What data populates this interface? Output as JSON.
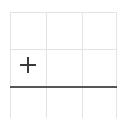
{
  "canvas": {
    "width": 127,
    "height": 125,
    "background": "#ffffff"
  },
  "colors": {
    "grid": "#e3e3e3",
    "axis_rule": "#555555",
    "marker": "#3a3a3a",
    "background": "#ffffff"
  },
  "chart_data": {
    "type": "scatter",
    "title": "",
    "subtitle": "",
    "xlabel": "",
    "ylabel": "",
    "grid": true,
    "legend": false,
    "legend_position": "none",
    "annotations": [],
    "xlim": [
      0,
      3
    ],
    "ylim": [
      0,
      3
    ],
    "xticks": [
      0,
      1,
      2,
      3
    ],
    "yticks": [
      0,
      1,
      2,
      3
    ],
    "xticklabels": [
      "",
      "",
      "",
      ""
    ],
    "yticklabels": [
      "",
      "",
      "",
      ""
    ],
    "series": [
      {
        "name": "",
        "marker": "plus",
        "color": "#3a3a3a",
        "x": [
          0.5
        ],
        "y": [
          1.5
        ]
      }
    ],
    "reference_lines": [
      {
        "name": "horizontal-rule",
        "orientation": "horizontal",
        "value": 1.0,
        "color": "#555555",
        "width": 2
      }
    ]
  },
  "grid": {
    "vertical_lines": [
      {
        "name": "grid-vertical-0",
        "x": 10,
        "y": 12,
        "length": 106
      },
      {
        "name": "grid-vertical-1",
        "x": 46,
        "y": 12,
        "length": 106
      },
      {
        "name": "grid-vertical-2",
        "x": 82,
        "y": 12,
        "length": 106
      },
      {
        "name": "grid-vertical-3",
        "x": 116,
        "y": 12,
        "length": 106
      }
    ],
    "horizontal_lines": [
      {
        "name": "grid-horizontal-0",
        "y": 12,
        "x": 10,
        "length": 107
      },
      {
        "name": "grid-horizontal-1",
        "y": 49,
        "x": 10,
        "length": 107
      }
    ]
  },
  "axis_rule": {
    "name": "axis-horizontal-rule",
    "x": 10,
    "y": 86,
    "length": 107,
    "thickness": 2
  },
  "marker": {
    "name": "plus-marker",
    "center_x": 28,
    "center_y": 65,
    "size": 16,
    "stroke": 2
  }
}
